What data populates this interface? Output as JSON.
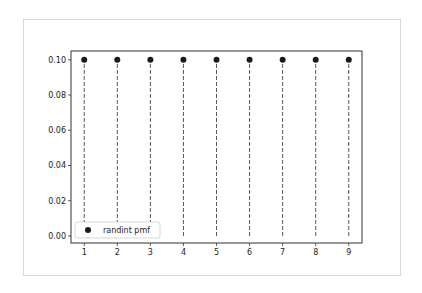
{
  "chart_data": {
    "type": "stem",
    "title": "",
    "xlabel": "",
    "ylabel": "",
    "x": [
      1,
      2,
      3,
      4,
      5,
      6,
      7,
      8,
      9
    ],
    "series": [
      {
        "name": "randint pmf",
        "values": [
          0.1,
          0.1,
          0.1,
          0.1,
          0.1,
          0.1,
          0.1,
          0.1,
          0.1
        ],
        "marker": "circle",
        "marker_color": "#1a1a1a",
        "stem_style": "dashed",
        "stem_color": "#555555"
      }
    ],
    "xticks": [
      "1",
      "2",
      "3",
      "4",
      "5",
      "6",
      "7",
      "8",
      "9"
    ],
    "yticks": [
      "0.00",
      "0.02",
      "0.04",
      "0.06",
      "0.08",
      "0.10"
    ],
    "ylim": [
      -0.004,
      0.105
    ],
    "xlim": [
      0.6,
      9.4
    ],
    "grid": false,
    "legend": {
      "position": "lower left",
      "entries": [
        "randint pmf"
      ]
    }
  }
}
